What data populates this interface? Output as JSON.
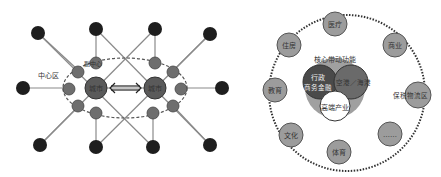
{
  "left_diagram": {
    "center_zone_label": "中心区",
    "sub_center_label": "副中心",
    "hub_glyph": "城市",
    "colors": {
      "outer_node": "#1e1e1e",
      "inner_node": "#6e6e6e",
      "hub": "#5a5a5a",
      "line": "#8a8a8a",
      "dashed": "#555555"
    }
  },
  "right_diagram": {
    "core_title": "核心带动功能",
    "core_circles": [
      {
        "label_line1": "行政",
        "label_line2": "商务金融",
        "color": "#4a4a4a"
      },
      {
        "label_line1": "空港／海港",
        "label_line2": "",
        "color": "#6a6a6a"
      },
      {
        "label_line1": "高端产业",
        "label_line2": "",
        "color": "#ffffff"
      }
    ],
    "core_background_color": "#9a9a9a",
    "satellite_nodes": [
      {
        "label": "医疗"
      },
      {
        "label": "商业"
      },
      {
        "label": "保税物流区"
      },
      {
        "label": "……"
      },
      {
        "label": "体育"
      },
      {
        "label": "文化"
      },
      {
        "label": "教育"
      },
      {
        "label": "住房"
      }
    ],
    "satellite_color": "#9c9c9c"
  }
}
